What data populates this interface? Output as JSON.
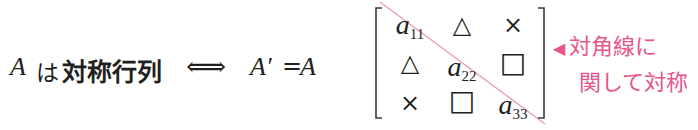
{
  "statement": {
    "var": "A",
    "particle": "は",
    "term": "対称行列",
    "iff": "⟺",
    "lhs": "A′",
    "eq": "=",
    "rhs": "A"
  },
  "matrix": {
    "rows": [
      [
        {
          "base": "a",
          "sub": "11"
        },
        {
          "sym": "△"
        },
        {
          "sym": "×"
        }
      ],
      [
        {
          "sym": "△"
        },
        {
          "base": "a",
          "sub": "22"
        },
        {
          "sym": "□"
        }
      ],
      [
        {
          "sym": "×"
        },
        {
          "sym": "□"
        },
        {
          "base": "a",
          "sub": "33"
        }
      ]
    ],
    "r0c0_base": "a",
    "r0c0_sub": "11",
    "r0c1": "△",
    "r0c2": "×",
    "r1c0": "△",
    "r1c1_base": "a",
    "r1c1_sub": "22",
    "r1c2": "□",
    "r2c0": "×",
    "r2c1": "□",
    "r2c2_base": "a",
    "r2c2_sub": "33",
    "diagonal_color": "#e8a0b8"
  },
  "note": {
    "arrow": "◀",
    "line1": "対角線に",
    "line2": "関して対称",
    "color": "#e8558a"
  }
}
